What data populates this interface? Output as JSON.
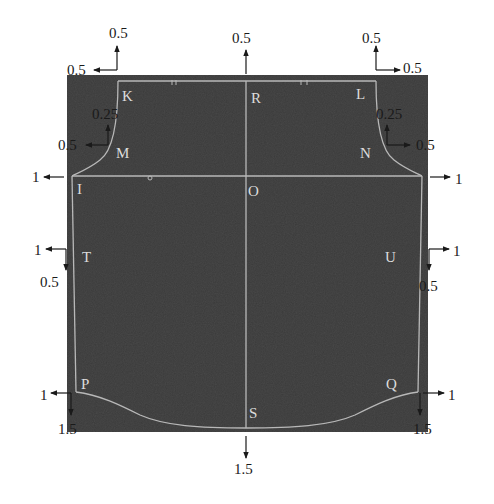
{
  "diagram": {
    "type": "garment pattern grading diagram",
    "colors": {
      "panel_fill": "#3a3a3a",
      "outline": "#b8b8b8",
      "label_text": "#dcdcdc",
      "annotation_text": "#1a1a1a",
      "arrow": "#1a1a1a",
      "background": "#ffffff"
    },
    "points": [
      {
        "id": "K",
        "label": "K"
      },
      {
        "id": "R",
        "label": "R"
      },
      {
        "id": "L",
        "label": "L"
      },
      {
        "id": "M",
        "label": "M"
      },
      {
        "id": "N",
        "label": "N"
      },
      {
        "id": "I",
        "label": "I"
      },
      {
        "id": "O",
        "label": "O"
      },
      {
        "id": "T",
        "label": "T"
      },
      {
        "id": "U",
        "label": "U"
      },
      {
        "id": "P",
        "label": "P"
      },
      {
        "id": "S",
        "label": "S"
      },
      {
        "id": "Q",
        "label": "Q"
      }
    ],
    "grading_annotations": {
      "K_up": "0.5",
      "K_left": "0.5",
      "R_up": "0.5",
      "L_up": "0.5",
      "L_right": "0.5",
      "M_up": "0.25",
      "M_left": "0.5",
      "N_up": "0.25",
      "N_right": "0.5",
      "I_left": "1",
      "I_right": "1",
      "T_left": "1",
      "T_down": "0.5",
      "U_right": "1",
      "U_down": "0.5",
      "P_left": "1",
      "P_down": "1.5",
      "S_down": "1.5",
      "Q_right": "1",
      "Q_down": "1.5"
    }
  }
}
